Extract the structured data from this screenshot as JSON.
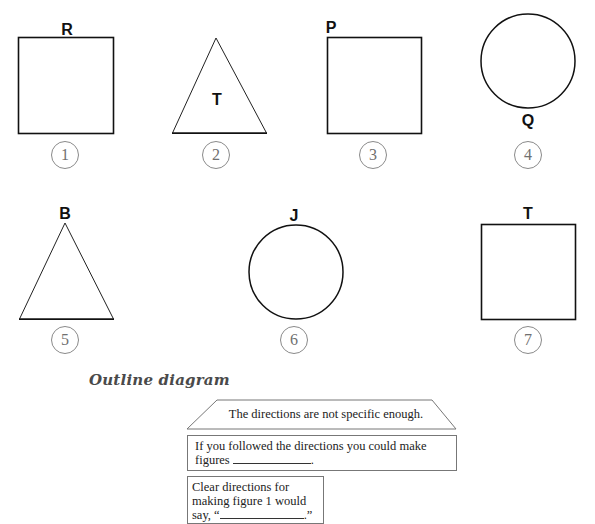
{
  "figures": [
    {
      "number": "1",
      "shape": "square",
      "label": "R",
      "label_position": "top-center"
    },
    {
      "number": "2",
      "shape": "triangle",
      "label": "T",
      "label_position": "inside-center"
    },
    {
      "number": "3",
      "shape": "square",
      "label": "P",
      "label_position": "top-left-corner"
    },
    {
      "number": "4",
      "shape": "circle",
      "label": "Q",
      "label_position": "bottom-center"
    },
    {
      "number": "5",
      "shape": "triangle",
      "label": "B",
      "label_position": "apex"
    },
    {
      "number": "6",
      "shape": "circle",
      "label": "J",
      "label_position": "top-center"
    },
    {
      "number": "7",
      "shape": "square",
      "label": "T",
      "label_position": "top-center"
    }
  ],
  "outline": {
    "heading": "Outline diagram",
    "main_idea": "The directions are not specific enough.",
    "detail_1_text": "If you followed the directions you could make figures",
    "detail_1_suffix": ".",
    "detail_2_line1": "Clear directions for",
    "detail_2_line2": "making figure 1 would",
    "detail_2_prefix": "say, “",
    "detail_2_suffix": ".”"
  },
  "colors": {
    "stroke": "#111111",
    "badge": "#8a8a8a",
    "box_border": "#777777"
  }
}
